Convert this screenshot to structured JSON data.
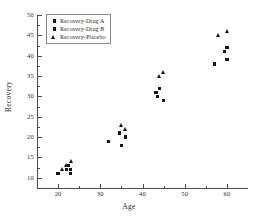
{
  "chart_data": {
    "type": "scatter",
    "title": "",
    "xlabel": "Age",
    "ylabel": "Recovery",
    "xlim": [
      15,
      65
    ],
    "ylim": [
      7.5,
      50
    ],
    "xticks": [
      20,
      30,
      40,
      50,
      60
    ],
    "yticks": [
      10,
      15,
      20,
      25,
      30,
      35,
      40,
      45,
      50
    ],
    "grid": false,
    "legend_position": "top-left",
    "series": [
      {
        "name": "Recovery-Drug A",
        "marker": "square",
        "color": "#141414",
        "points": [
          {
            "x": 20,
            "y": 11
          },
          {
            "x": 22,
            "y": 12
          },
          {
            "x": 23,
            "y": 11
          },
          {
            "x": 32,
            "y": 19
          },
          {
            "x": 34.5,
            "y": 21
          },
          {
            "x": 43.5,
            "y": 30
          },
          {
            "x": 44,
            "y": 32
          },
          {
            "x": 57,
            "y": 38
          },
          {
            "x": 59.5,
            "y": 41
          }
        ]
      },
      {
        "name": "Recovery-Drug B",
        "marker": "square",
        "color": "#141414",
        "points": [
          {
            "x": 22.5,
            "y": 13
          },
          {
            "x": 23,
            "y": 12
          },
          {
            "x": 35,
            "y": 18
          },
          {
            "x": 36,
            "y": 20
          },
          {
            "x": 43.2,
            "y": 31
          },
          {
            "x": 45,
            "y": 29
          },
          {
            "x": 60,
            "y": 42
          },
          {
            "x": 60,
            "y": 39
          }
        ]
      },
      {
        "name": "Recovery-Placebo",
        "marker": "triangle",
        "color": "#141414",
        "points": [
          {
            "x": 21,
            "y": 12
          },
          {
            "x": 22,
            "y": 13
          },
          {
            "x": 23,
            "y": 14
          },
          {
            "x": 35,
            "y": 23
          },
          {
            "x": 36,
            "y": 22
          },
          {
            "x": 44,
            "y": 35
          },
          {
            "x": 45,
            "y": 36
          },
          {
            "x": 58,
            "y": 45
          },
          {
            "x": 60,
            "y": 46
          }
        ]
      }
    ]
  },
  "axes": {
    "x_title": "Age",
    "y_title": "Recovery",
    "x_tick_labels": [
      "20",
      "30",
      "40",
      "50",
      "60"
    ],
    "y_tick_labels": [
      "10",
      "15",
      "20",
      "25",
      "30",
      "35",
      "40",
      "45",
      "50"
    ]
  },
  "legend": {
    "entries": [
      {
        "label": "Recovery-Drug A",
        "marker": "square"
      },
      {
        "label": "Recovery-Drug B",
        "marker": "square"
      },
      {
        "label": "Recovery-Placebo",
        "marker": "triangle"
      }
    ]
  }
}
